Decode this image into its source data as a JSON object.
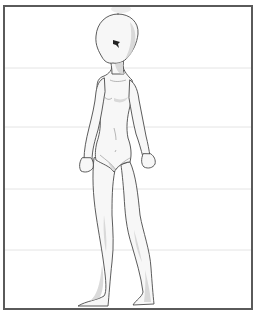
{
  "image": {
    "width": 257,
    "height": 316,
    "subject": "anime-style female body mannequin, standing three-quarter view",
    "background": "#ffffff"
  },
  "frame": {
    "x": 4,
    "y": 6,
    "width": 248,
    "height": 303,
    "stroke": "#5a5a5a",
    "stroke_width": 2
  },
  "guide_lines": {
    "color": "#e4e4e4",
    "y_positions": [
      68,
      127,
      189,
      250
    ]
  },
  "figure": {
    "skin_fill": "#f7f7f7",
    "shade": "#d0d0d0",
    "outline": "#4a4a4a",
    "eye_color": "#222222"
  }
}
